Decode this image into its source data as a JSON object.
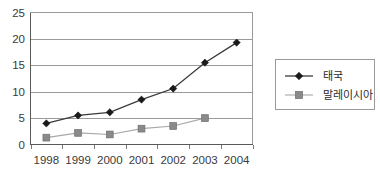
{
  "chart_data": {
    "type": "line",
    "title": "",
    "xlabel": "",
    "ylabel": "",
    "categories": [
      "1998",
      "1999",
      "2000",
      "2001",
      "2002",
      "2003",
      "2004"
    ],
    "ylim": [
      0,
      25
    ],
    "yticks": [
      "0",
      "5",
      "10",
      "15",
      "20",
      "25"
    ],
    "ytick_values": [
      0,
      5,
      10,
      15,
      20,
      25
    ],
    "grid": true,
    "legend_position": "right",
    "series": [
      {
        "name": "태국",
        "marker": "diamond",
        "color": "#1a1a1a",
        "line_color": "#3a3a3a",
        "values": [
          4.0,
          5.5,
          6.1,
          8.5,
          10.6,
          15.5,
          19.3
        ]
      },
      {
        "name": "말레이시아",
        "marker": "square",
        "color": "#8a8a8a",
        "line_color": "#a8a8a8",
        "values": [
          1.3,
          2.2,
          1.9,
          3.0,
          3.5,
          5.0,
          null
        ]
      }
    ]
  },
  "legend": {
    "entries": [
      {
        "label": "태국"
      },
      {
        "label": "말레이시아"
      }
    ]
  },
  "colors": {
    "background": "#ffffff",
    "grid": "#9a9a9a",
    "axis": "#5a5a5a",
    "text": "#3a3a3a",
    "series_thailand": "#1a1a1a",
    "series_malaysia": "#8a8a8a"
  }
}
